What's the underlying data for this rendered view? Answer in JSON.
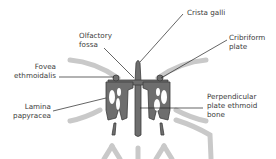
{
  "diagram": {
    "colors": {
      "bone": "#6e6e6e",
      "bone_outline": "#3d3d3d",
      "background_structures": "#c9c9c9",
      "leader": "#222222",
      "text": "#3a3a3a"
    },
    "labels": [
      {
        "id": "crista-galli",
        "text": "Crista galli"
      },
      {
        "id": "olfactory-fossa",
        "text": "Olfactory\nfossa"
      },
      {
        "id": "cribriform-plate",
        "text": "Cribriform\nplate"
      },
      {
        "id": "fovea-ethmoidalis",
        "text": "Fovea\nethmoidalis"
      },
      {
        "id": "lamina-papyracea",
        "text": "Lamina\npapyracea"
      },
      {
        "id": "perpendicular-plate",
        "text": "Perpendicular\nplate ethmoid\nbone"
      }
    ]
  }
}
